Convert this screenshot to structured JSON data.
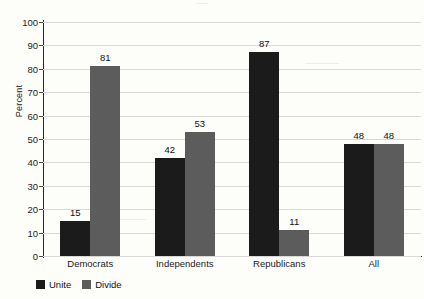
{
  "chart_data": {
    "type": "bar",
    "title": "",
    "xlabel": "",
    "ylabel": "Percent",
    "ylim": [
      0,
      100
    ],
    "ytick_step": 10,
    "yticks": [
      0,
      10,
      20,
      30,
      40,
      50,
      60,
      70,
      80,
      90,
      100
    ],
    "grid": true,
    "legend_position": "bottom-left",
    "categories": [
      "Democrats",
      "Independents",
      "Republicans",
      "All"
    ],
    "series": [
      {
        "name": "Unite",
        "color": "#1b1b1b",
        "values": [
          15,
          42,
          87,
          48
        ]
      },
      {
        "name": "Divide",
        "color": "#5c5c5c",
        "values": [
          81,
          53,
          11,
          48
        ]
      }
    ]
  },
  "axis": {
    "y_title": "Percent",
    "tick_labels": [
      "100",
      "90",
      "80",
      "70",
      "60",
      "50",
      "40",
      "30",
      "20",
      "10",
      "0"
    ],
    "category_labels": [
      "Democrats",
      "Independents",
      "Republicans",
      "All"
    ]
  },
  "bar_labels": {
    "democrats_unite": "15",
    "democrats_divide": "81",
    "independents_unite": "42",
    "independents_divide": "53",
    "republicans_unite": "87",
    "republicans_divide": "11",
    "all_unite": "48",
    "all_divide": "48"
  },
  "legend": {
    "items": [
      {
        "label": "Unite",
        "color": "#1b1b1b"
      },
      {
        "label": "Divide",
        "color": "#5c5c5c"
      }
    ]
  }
}
